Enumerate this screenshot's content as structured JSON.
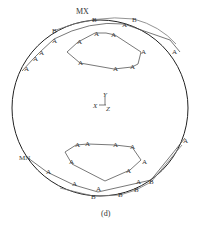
{
  "figure": {
    "caption": "(d)",
    "labels": {
      "max": "MX",
      "min": "MN"
    },
    "axes": {
      "y": "Y",
      "x": "X",
      "z": "Z"
    },
    "markers": {
      "a": "A",
      "b": "B"
    },
    "colors": {
      "circle": "#222222",
      "curve": "#555555",
      "text": "#333333"
    }
  }
}
